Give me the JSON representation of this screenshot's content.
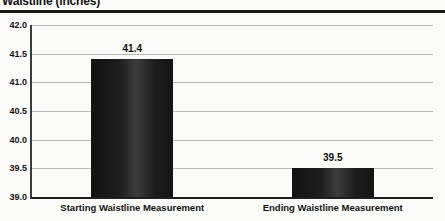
{
  "title": {
    "text": "Waistline (inches)"
  },
  "chart_data": {
    "type": "bar",
    "title": "Waistline (inches)",
    "categories": [
      "Starting Waistline Measurement",
      "Ending Waistline Measurement"
    ],
    "values": [
      41.4,
      39.5
    ],
    "value_labels": [
      "41.4",
      "39.5"
    ],
    "xlabel": "",
    "ylabel": "",
    "ylim": [
      39.0,
      42.0
    ],
    "ytick_step": 0.5,
    "ytick_labels": [
      "42.0",
      "41.5",
      "41.0",
      "40.5",
      "40.0",
      "39.5",
      "39.0"
    ],
    "grid": true,
    "legend": "none",
    "colors": {
      "bar": "#1c1c1c",
      "gridline": "#b9b9b6",
      "axis": "#2b2b2b",
      "title_rule": "#1a1a1a",
      "text": "#111111",
      "background": "#fbfbf9"
    }
  }
}
